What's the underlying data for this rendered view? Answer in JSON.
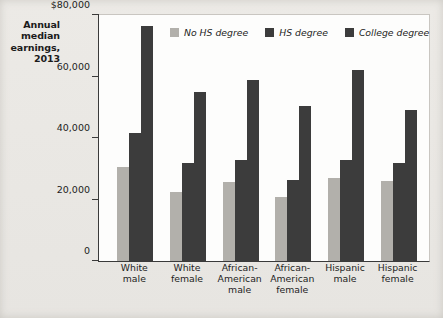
{
  "chart_data": {
    "type": "bar",
    "title": "Annual median earnings, 2013",
    "xlabel": "",
    "ylabel": "Annual median earnings, 2013",
    "ylim": [
      0,
      80000
    ],
    "yticks": [
      0,
      20000,
      40000,
      60000,
      80000
    ],
    "ytick_labels": [
      "0",
      "20,000",
      "40,000",
      "60,000",
      "$80,000"
    ],
    "grid": false,
    "legend_position": "top-center",
    "categories": [
      "White male",
      "White female",
      "African-American male",
      "African-American female",
      "Hispanic male",
      "Hispanic female"
    ],
    "category_lines": [
      [
        "White",
        "male"
      ],
      [
        "White",
        "female"
      ],
      [
        "African-",
        "American",
        "male"
      ],
      [
        "African-",
        "American",
        "female"
      ],
      [
        "Hispanic",
        "male"
      ],
      [
        "Hispanic",
        "female"
      ]
    ],
    "series": [
      {
        "name": "No HS degree",
        "color": "#b2b0ab",
        "values": [
          30500,
          22500,
          25800,
          20800,
          27000,
          26000
        ]
      },
      {
        "name": "HS degree",
        "color": "#3c3c3c",
        "values": [
          41500,
          31800,
          33000,
          26500,
          32700,
          32000
        ]
      },
      {
        "name": "College degree",
        "color": "#3c3c3c",
        "values": [
          76500,
          55000,
          59000,
          50500,
          62000,
          49000
        ]
      }
    ]
  },
  "colors": {
    "background": "#e9e7e3",
    "plot_background": "#fdfdfc",
    "axis": "#3a3a3a",
    "text": "#1d1d1d",
    "light_gray_series": "#b2b0ab",
    "dark_gray_series": "#3c3c3c"
  }
}
